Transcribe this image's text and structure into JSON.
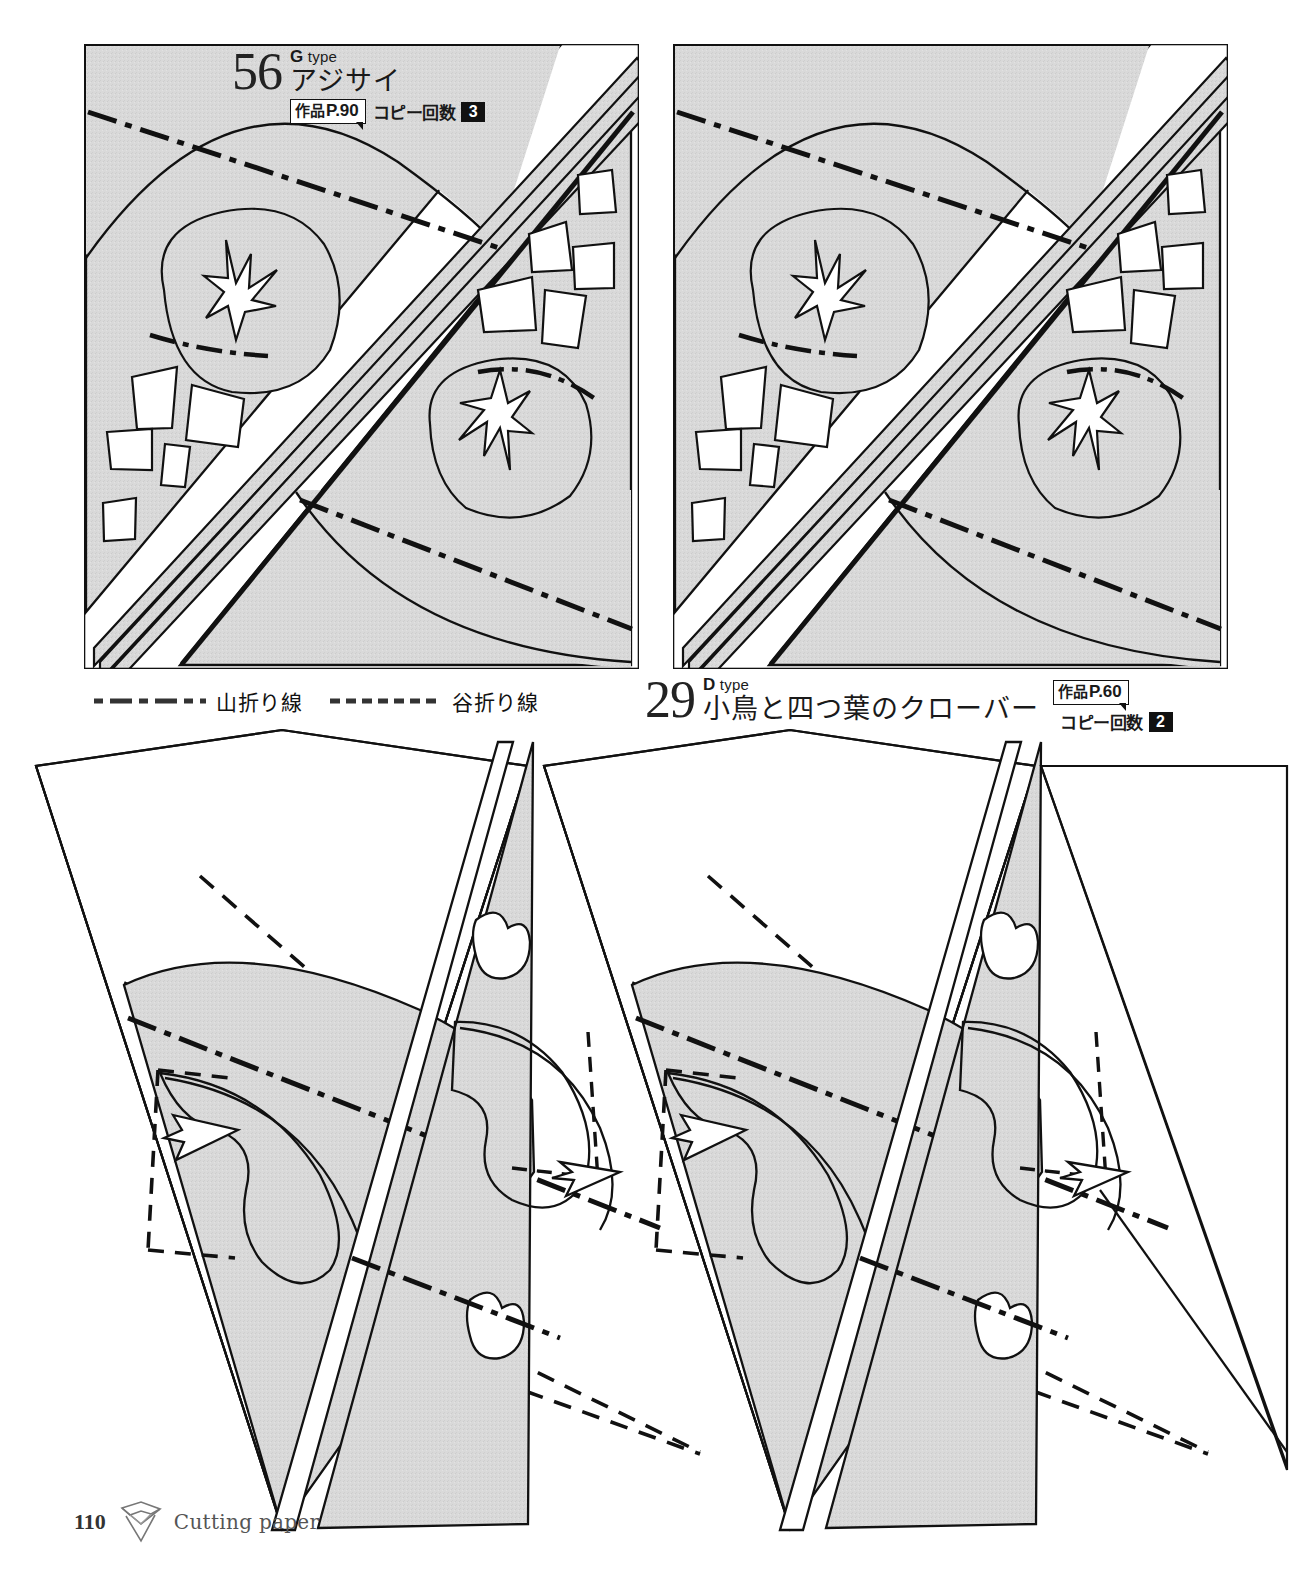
{
  "page": {
    "number": "110",
    "caption": "Cutting paper",
    "icon": "folded-paper-icon",
    "paper_fill": "#d8d8d8",
    "ink": "#111111"
  },
  "patterns": [
    {
      "id": "pattern-56",
      "number": "56",
      "type_letter": "G",
      "type_word": "type",
      "name": "アジサイ",
      "work_label": "作品",
      "work_page": "P.90",
      "copy_label": "コピー回数",
      "copy_count": "3",
      "motif": "hydrangea"
    },
    {
      "id": "pattern-29",
      "number": "29",
      "type_letter": "D",
      "type_word": "type",
      "name": "小鳥と四つ葉のクローバー",
      "work_label": "作品",
      "work_page": "P.60",
      "copy_label": "コピー回数",
      "copy_count": "2",
      "motif": "bird-and-four-leaf-clover"
    }
  ],
  "legend": {
    "items": [
      {
        "label": "山折り線",
        "style": "dash-dot",
        "name": "mountain-fold"
      },
      {
        "label": "谷折り線",
        "style": "dashed",
        "name": "valley-fold"
      }
    ]
  }
}
